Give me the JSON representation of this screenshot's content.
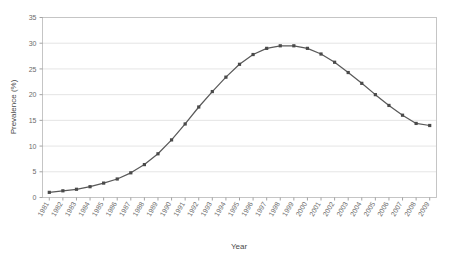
{
  "chart_data": {
    "type": "line",
    "title": "",
    "xlabel": "Year",
    "ylabel": "Prevalence (%)",
    "xlim": [
      1981,
      2009
    ],
    "ylim": [
      0,
      35
    ],
    "ytick_step": 5,
    "yticks": [
      0,
      5,
      10,
      15,
      20,
      25,
      30,
      35
    ],
    "ytick_labels": [
      "0",
      "5",
      "10",
      "15",
      "20",
      "25",
      "30",
      "35"
    ],
    "categories": [
      "1981",
      "1982",
      "1983",
      "1984",
      "1985",
      "1986",
      "1987",
      "1988",
      "1989",
      "1990",
      "1991",
      "1992",
      "1993",
      "1994",
      "1995",
      "1996",
      "1997",
      "1998",
      "1999",
      "2000",
      "2001",
      "2002",
      "2003",
      "2004",
      "2005",
      "2006",
      "2007",
      "2008",
      "2009"
    ],
    "values": [
      1.0,
      1.3,
      1.6,
      2.1,
      2.8,
      3.6,
      4.8,
      6.4,
      8.5,
      11.2,
      14.3,
      17.6,
      20.6,
      23.4,
      25.9,
      27.8,
      29.0,
      29.5,
      29.5,
      29.0,
      27.9,
      26.3,
      24.3,
      22.2,
      20.0,
      17.9,
      16.0,
      14.4,
      14.0
    ],
    "series": [
      {
        "name": "Prevalence",
        "color": "#595959",
        "marker": "square",
        "values": [
          1.0,
          1.3,
          1.6,
          2.1,
          2.8,
          3.6,
          4.8,
          6.4,
          8.5,
          11.2,
          14.3,
          17.6,
          20.6,
          23.4,
          25.9,
          27.8,
          29.0,
          29.5,
          29.5,
          29.0,
          27.9,
          26.3,
          24.3,
          22.2,
          20.0,
          17.9,
          16.0,
          14.4,
          14.0
        ]
      }
    ],
    "grid": true,
    "grid_axis": "y",
    "legend": false,
    "legend_position": "none",
    "colors": {
      "line": "#595959",
      "marker": "#4a4a4a",
      "grid": "#d9d9d9",
      "frame": "#bfbfbf",
      "text": "#6b6b6b",
      "background": "#ffffff"
    }
  }
}
